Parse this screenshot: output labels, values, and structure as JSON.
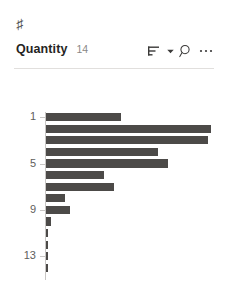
{
  "panel": {
    "type_icon": "hash-icon",
    "column_name": "Quantity",
    "distinct_count": "14"
  },
  "toolbar": {
    "items": [
      {
        "icon": "sort-icon",
        "label": "Sort"
      },
      {
        "icon": "chevron-down-icon",
        "label": "Sort options"
      },
      {
        "icon": "search-icon",
        "label": "Search"
      },
      {
        "icon": "more-options-icon",
        "label": "More options"
      }
    ]
  },
  "colors": {
    "bar": "#4c4a48",
    "axis": "#c8c6c4",
    "tick_text": "#605e5c",
    "title_text": "#252423",
    "count_text": "#8a8886",
    "divider": "#e1dfdd",
    "background": "#ffffff"
  },
  "chart_data": {
    "type": "bar",
    "orientation": "horizontal",
    "title": "",
    "subtitle": "",
    "xlabel": "",
    "ylabel": "",
    "grid": false,
    "legend": "none",
    "categories": [
      "1",
      "2",
      "3",
      "4",
      "5",
      "6",
      "7",
      "8",
      "9",
      "10",
      "11",
      "12",
      "13",
      "14"
    ],
    "tick_labels": [
      "1",
      "5",
      "9",
      "13"
    ],
    "tick_category_indices": [
      0,
      4,
      8,
      12
    ],
    "values": [
      44,
      97,
      95,
      66,
      72,
      34,
      40,
      11,
      14,
      3,
      1,
      1,
      1,
      1
    ],
    "xlim": [
      0,
      100
    ],
    "ylim_categories": [
      "1",
      "14"
    ],
    "series": [
      {
        "name": "Quantity distribution",
        "values": [
          44,
          97,
          95,
          66,
          72,
          34,
          40,
          11,
          14,
          3,
          1,
          1,
          1,
          1
        ]
      }
    ]
  }
}
